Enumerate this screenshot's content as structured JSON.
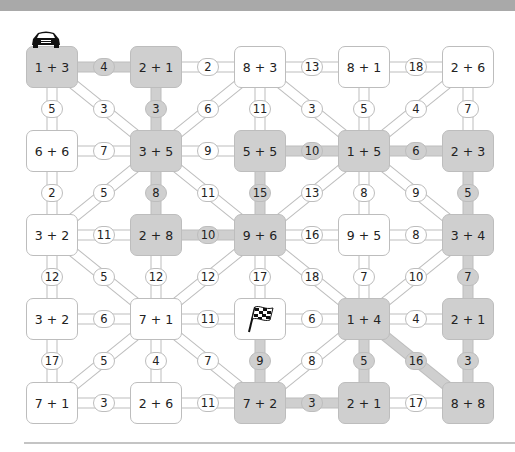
{
  "colors": {
    "shaded": "#cfcfcf",
    "stroke": "#bdbdbd",
    "banner": "#a9a9a9"
  },
  "icons": {
    "start": "car-icon",
    "finish": "checkered-flag-icon"
  },
  "grid": {
    "cols_x": [
      52,
      156,
      260,
      364,
      468
    ],
    "rows_y": [
      67,
      151,
      235,
      319,
      403
    ]
  },
  "boxes": [
    {
      "id": "r0c0",
      "r": 0,
      "c": 0,
      "label": "1 + 3",
      "shaded": true,
      "start": true
    },
    {
      "id": "r0c1",
      "r": 0,
      "c": 1,
      "label": "2 + 1",
      "shaded": true
    },
    {
      "id": "r0c2",
      "r": 0,
      "c": 2,
      "label": "8 + 3",
      "shaded": false
    },
    {
      "id": "r0c3",
      "r": 0,
      "c": 3,
      "label": "8 + 1",
      "shaded": false
    },
    {
      "id": "r0c4",
      "r": 0,
      "c": 4,
      "label": "2 + 6",
      "shaded": false
    },
    {
      "id": "r1c0",
      "r": 1,
      "c": 0,
      "label": "6 + 6",
      "shaded": false
    },
    {
      "id": "r1c1",
      "r": 1,
      "c": 1,
      "label": "3 + 5",
      "shaded": true
    },
    {
      "id": "r1c2",
      "r": 1,
      "c": 2,
      "label": "5 + 5",
      "shaded": true
    },
    {
      "id": "r1c3",
      "r": 1,
      "c": 3,
      "label": "1 + 5",
      "shaded": true
    },
    {
      "id": "r1c4",
      "r": 1,
      "c": 4,
      "label": "2 + 3",
      "shaded": true
    },
    {
      "id": "r2c0",
      "r": 2,
      "c": 0,
      "label": "3 + 2",
      "shaded": false
    },
    {
      "id": "r2c1",
      "r": 2,
      "c": 1,
      "label": "2 + 8",
      "shaded": true
    },
    {
      "id": "r2c2",
      "r": 2,
      "c": 2,
      "label": "9 + 6",
      "shaded": true
    },
    {
      "id": "r2c3",
      "r": 2,
      "c": 3,
      "label": "9 + 5",
      "shaded": false
    },
    {
      "id": "r2c4",
      "r": 2,
      "c": 4,
      "label": "3 + 4",
      "shaded": true
    },
    {
      "id": "r3c0",
      "r": 3,
      "c": 0,
      "label": "3 + 2",
      "shaded": false
    },
    {
      "id": "r3c1",
      "r": 3,
      "c": 1,
      "label": "7 + 1",
      "shaded": false
    },
    {
      "id": "r3c2",
      "r": 3,
      "c": 2,
      "label": "",
      "shaded": false,
      "finish": true
    },
    {
      "id": "r3c3",
      "r": 3,
      "c": 3,
      "label": "1 + 4",
      "shaded": true
    },
    {
      "id": "r3c4",
      "r": 3,
      "c": 4,
      "label": "2 + 1",
      "shaded": true
    },
    {
      "id": "r4c0",
      "r": 4,
      "c": 0,
      "label": "7 + 1",
      "shaded": false
    },
    {
      "id": "r4c1",
      "r": 4,
      "c": 1,
      "label": "2 + 6",
      "shaded": false
    },
    {
      "id": "r4c2",
      "r": 4,
      "c": 2,
      "label": "7 + 2",
      "shaded": true
    },
    {
      "id": "r4c3",
      "r": 4,
      "c": 3,
      "label": "2 + 1",
      "shaded": true
    },
    {
      "id": "r4c4",
      "r": 4,
      "c": 4,
      "label": "8 + 8",
      "shaded": true
    }
  ],
  "links": [
    {
      "from": "r0c0",
      "to": "r0c1",
      "label": "4",
      "shaded": true
    },
    {
      "from": "r0c1",
      "to": "r0c2",
      "label": "2",
      "shaded": false
    },
    {
      "from": "r0c2",
      "to": "r0c3",
      "label": "13",
      "shaded": false
    },
    {
      "from": "r0c3",
      "to": "r0c4",
      "label": "18",
      "shaded": false
    },
    {
      "from": "r0c0",
      "to": "r1c0",
      "label": "5",
      "shaded": false
    },
    {
      "from": "r0c0",
      "to": "r1c1",
      "label": "3",
      "shaded": false
    },
    {
      "from": "r0c1",
      "to": "r1c1",
      "label": "3",
      "shaded": true
    },
    {
      "from": "r0c2",
      "to": "r1c1",
      "label": "6",
      "shaded": false
    },
    {
      "from": "r0c2",
      "to": "r1c2",
      "label": "11",
      "shaded": false
    },
    {
      "from": "r0c2",
      "to": "r1c3",
      "label": "3",
      "shaded": false
    },
    {
      "from": "r0c3",
      "to": "r1c3",
      "label": "5",
      "shaded": false
    },
    {
      "from": "r0c4",
      "to": "r1c3",
      "label": "4",
      "shaded": false
    },
    {
      "from": "r0c4",
      "to": "r1c4",
      "label": "7",
      "shaded": false
    },
    {
      "from": "r1c0",
      "to": "r1c1",
      "label": "7",
      "shaded": false
    },
    {
      "from": "r1c1",
      "to": "r1c2",
      "label": "9",
      "shaded": false
    },
    {
      "from": "r1c2",
      "to": "r1c3",
      "label": "10",
      "shaded": true
    },
    {
      "from": "r1c3",
      "to": "r1c4",
      "label": "6",
      "shaded": true
    },
    {
      "from": "r1c0",
      "to": "r2c0",
      "label": "2",
      "shaded": false
    },
    {
      "from": "r1c1",
      "to": "r2c0",
      "label": "5",
      "shaded": false
    },
    {
      "from": "r1c1",
      "to": "r2c1",
      "label": "8",
      "shaded": true
    },
    {
      "from": "r1c1",
      "to": "r2c2",
      "label": "11",
      "shaded": false
    },
    {
      "from": "r1c2",
      "to": "r2c2",
      "label": "15",
      "shaded": true
    },
    {
      "from": "r1c3",
      "to": "r2c2",
      "label": "13",
      "shaded": false
    },
    {
      "from": "r1c3",
      "to": "r2c3",
      "label": "8",
      "shaded": false
    },
    {
      "from": "r1c3",
      "to": "r2c4",
      "label": "9",
      "shaded": false
    },
    {
      "from": "r1c4",
      "to": "r2c4",
      "label": "5",
      "shaded": true
    },
    {
      "from": "r2c0",
      "to": "r2c1",
      "label": "11",
      "shaded": false
    },
    {
      "from": "r2c1",
      "to": "r2c2",
      "label": "10",
      "shaded": true
    },
    {
      "from": "r2c2",
      "to": "r2c3",
      "label": "16",
      "shaded": false
    },
    {
      "from": "r2c3",
      "to": "r2c4",
      "label": "8",
      "shaded": false
    },
    {
      "from": "r2c0",
      "to": "r3c0",
      "label": "12",
      "shaded": false
    },
    {
      "from": "r2c0",
      "to": "r3c1",
      "label": "5",
      "shaded": false
    },
    {
      "from": "r2c1",
      "to": "r3c1",
      "label": "12",
      "shaded": false
    },
    {
      "from": "r2c2",
      "to": "r3c1",
      "label": "12",
      "shaded": false
    },
    {
      "from": "r2c2",
      "to": "r3c2",
      "label": "17",
      "shaded": false
    },
    {
      "from": "r2c2",
      "to": "r3c3",
      "label": "18",
      "shaded": false
    },
    {
      "from": "r2c3",
      "to": "r3c3",
      "label": "7",
      "shaded": false
    },
    {
      "from": "r2c4",
      "to": "r3c3",
      "label": "10",
      "shaded": false
    },
    {
      "from": "r2c4",
      "to": "r3c4",
      "label": "7",
      "shaded": true
    },
    {
      "from": "r3c0",
      "to": "r3c1",
      "label": "6",
      "shaded": false
    },
    {
      "from": "r3c1",
      "to": "r3c2",
      "label": "11",
      "shaded": false
    },
    {
      "from": "r3c2",
      "to": "r3c3",
      "label": "6",
      "shaded": false
    },
    {
      "from": "r3c3",
      "to": "r3c4",
      "label": "4",
      "shaded": false
    },
    {
      "from": "r3c0",
      "to": "r4c0",
      "label": "17",
      "shaded": false
    },
    {
      "from": "r3c1",
      "to": "r4c0",
      "label": "5",
      "shaded": false
    },
    {
      "from": "r3c1",
      "to": "r4c1",
      "label": "4",
      "shaded": false
    },
    {
      "from": "r3c1",
      "to": "r4c2",
      "label": "7",
      "shaded": false
    },
    {
      "from": "r3c2",
      "to": "r4c2",
      "label": "9",
      "shaded": true
    },
    {
      "from": "r3c3",
      "to": "r4c2",
      "label": "8",
      "shaded": false
    },
    {
      "from": "r3c3",
      "to": "r4c3",
      "label": "5",
      "shaded": true
    },
    {
      "from": "r3c3",
      "to": "r4c4",
      "label": "16",
      "shaded": true
    },
    {
      "from": "r3c4",
      "to": "r4c4",
      "label": "3",
      "shaded": true
    },
    {
      "from": "r4c0",
      "to": "r4c1",
      "label": "3",
      "shaded": false
    },
    {
      "from": "r4c1",
      "to": "r4c2",
      "label": "11",
      "shaded": false
    },
    {
      "from": "r4c2",
      "to": "r4c3",
      "label": "3",
      "shaded": true
    },
    {
      "from": "r4c3",
      "to": "r4c4",
      "label": "17",
      "shaded": false
    }
  ]
}
